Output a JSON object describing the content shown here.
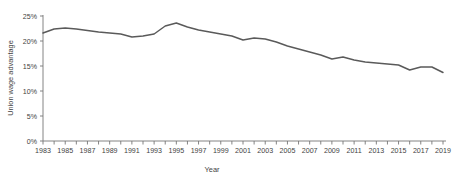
{
  "chart_data": {
    "type": "line",
    "title": "",
    "xlabel": "Year",
    "ylabel": "Union wage advantage",
    "xlim": [
      1983,
      2019
    ],
    "ylim": [
      0,
      25
    ],
    "grid": false,
    "legend": null,
    "line_color": "#5a5a5a",
    "axis_color": "#767676",
    "y_ticks": [
      0,
      5,
      10,
      15,
      20,
      25
    ],
    "y_tick_labels": [
      "0%",
      "5%",
      "10%",
      "15%",
      "20%",
      "25%"
    ],
    "x_ticks": [
      1983,
      1984,
      1985,
      1986,
      1987,
      1988,
      1989,
      1990,
      1991,
      1992,
      1993,
      1994,
      1995,
      1996,
      1997,
      1998,
      1999,
      2000,
      2001,
      2002,
      2003,
      2004,
      2005,
      2006,
      2007,
      2008,
      2009,
      2010,
      2011,
      2012,
      2013,
      2014,
      2015,
      2016,
      2017,
      2018,
      2019
    ],
    "x_tick_labels": [
      "1983",
      "",
      "1985",
      "",
      "1987",
      "",
      "1989",
      "",
      "1991",
      "",
      "1993",
      "",
      "1995",
      "",
      "1997",
      "",
      "1999",
      "",
      "2001",
      "",
      "2003",
      "",
      "2005",
      "",
      "2007",
      "",
      "2009",
      "",
      "2011",
      "",
      "2013",
      "",
      "2015",
      "",
      "2017",
      "",
      "2019"
    ],
    "x": [
      1983,
      1984,
      1985,
      1986,
      1987,
      1988,
      1989,
      1990,
      1991,
      1992,
      1993,
      1994,
      1995,
      1996,
      1997,
      1998,
      1999,
      2000,
      2001,
      2002,
      2003,
      2004,
      2005,
      2006,
      2007,
      2008,
      2009,
      2010,
      2011,
      2012,
      2013,
      2014,
      2015,
      2016,
      2017,
      2018,
      2019
    ],
    "values": [
      21.6,
      22.4,
      22.6,
      22.4,
      22.1,
      21.8,
      21.6,
      21.4,
      20.8,
      21.0,
      21.4,
      23.0,
      23.6,
      22.8,
      22.2,
      21.8,
      21.4,
      21.0,
      20.2,
      20.6,
      20.4,
      19.8,
      19.0,
      18.4,
      17.8,
      17.2,
      16.4,
      16.8,
      16.2,
      15.8,
      15.6,
      15.4,
      15.2,
      14.2,
      14.8,
      14.8,
      13.7
    ],
    "series": [
      {
        "name": "Union wage advantage",
        "values": [
          21.6,
          22.4,
          22.6,
          22.4,
          22.1,
          21.8,
          21.6,
          21.4,
          20.8,
          21.0,
          21.4,
          23.0,
          23.6,
          22.8,
          22.2,
          21.8,
          21.4,
          21.0,
          20.2,
          20.6,
          20.4,
          19.8,
          19.0,
          18.4,
          17.8,
          17.2,
          16.4,
          16.8,
          16.2,
          15.8,
          15.6,
          15.4,
          15.2,
          14.2,
          14.8,
          14.8,
          13.7
        ]
      }
    ]
  }
}
